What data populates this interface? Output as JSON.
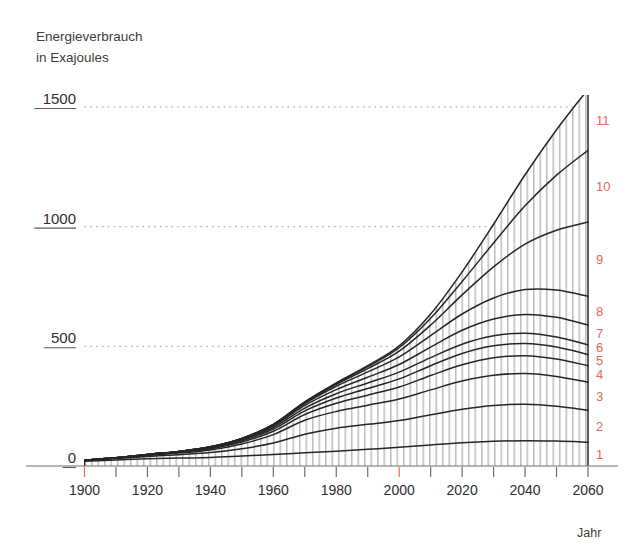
{
  "chart_data": {
    "type": "area",
    "title": "Energieverbrauch in Exajoules",
    "title_line1": "Energieverbrauch",
    "title_line2": "in Exajoules",
    "ylabel": "Energieverbrauch in Exajoules",
    "xlabel": "Jahr",
    "grid": true,
    "legend_position": "right-inline",
    "xlim": [
      1900,
      2060
    ],
    "ylim": [
      0,
      1550
    ],
    "yticks": [
      0,
      500,
      1000,
      1500
    ],
    "ytick_labels": [
      "0",
      "500",
      "1000",
      "1500"
    ],
    "xticks": [
      1900,
      1920,
      1940,
      1960,
      1980,
      2000,
      2020,
      2040,
      2060
    ],
    "xtick_labels": [
      "1900",
      "1920",
      "1940",
      "1960",
      "1980",
      "2000",
      "2020",
      "2040",
      "2060"
    ],
    "xticks_minor": [
      1910,
      1930,
      1950,
      1970,
      1990,
      2010,
      2030,
      2050
    ],
    "xticks_highlight": [
      1900,
      2000
    ],
    "highlight_color": "#e4675b",
    "line_color": "#262626",
    "hatch_color": "#9a9a9a",
    "grid_color": "#9a9a9a",
    "axis_color": "#6e6e6e",
    "x": [
      1900,
      1910,
      1920,
      1930,
      1940,
      1950,
      1960,
      1970,
      1980,
      1990,
      2000,
      2010,
      2020,
      2030,
      2040,
      2050,
      2060
    ],
    "series": [
      {
        "name": "1",
        "label": "1",
        "values": [
          20,
          25,
          30,
          33,
          36,
          42,
          48,
          55,
          62,
          70,
          78,
          88,
          97,
          103,
          106,
          104,
          99
        ]
      },
      {
        "name": "2",
        "label": "2",
        "values": [
          3,
          6,
          10,
          14,
          20,
          30,
          48,
          78,
          96,
          104,
          112,
          126,
          140,
          150,
          152,
          146,
          134
        ]
      },
      {
        "name": "3",
        "label": "3",
        "values": [
          1,
          2,
          4,
          7,
          11,
          20,
          35,
          58,
          70,
          80,
          90,
          104,
          118,
          126,
          128,
          124,
          117
        ]
      },
      {
        "name": "4",
        "label": "4",
        "values": [
          0,
          1,
          2,
          3,
          5,
          8,
          14,
          24,
          34,
          42,
          50,
          60,
          68,
          73,
          75,
          73,
          69
        ]
      },
      {
        "name": "5",
        "label": "5",
        "values": [
          0,
          0,
          1,
          2,
          3,
          5,
          9,
          15,
          22,
          28,
          34,
          41,
          47,
          50,
          51,
          50,
          47
        ]
      },
      {
        "name": "6",
        "label": "6",
        "values": [
          0,
          0,
          1,
          1,
          2,
          4,
          7,
          12,
          18,
          23,
          28,
          34,
          39,
          42,
          43,
          42,
          40
        ]
      },
      {
        "name": "7",
        "label": "7",
        "values": [
          0,
          0,
          0,
          1,
          2,
          3,
          6,
          11,
          17,
          24,
          32,
          44,
          58,
          70,
          78,
          82,
          83
        ]
      },
      {
        "name": "8",
        "label": "8",
        "values": [
          0,
          0,
          0,
          0,
          1,
          2,
          4,
          8,
          14,
          22,
          32,
          48,
          68,
          88,
          104,
          114,
          120
        ]
      },
      {
        "name": "9",
        "label": "9",
        "values": [
          0,
          0,
          0,
          0,
          0,
          1,
          2,
          4,
          8,
          14,
          24,
          44,
          80,
          130,
          190,
          250,
          310
        ]
      },
      {
        "name": "10",
        "label": "10",
        "values": [
          0,
          0,
          0,
          0,
          0,
          0,
          1,
          2,
          4,
          8,
          14,
          28,
          56,
          100,
          160,
          230,
          300
        ]
      },
      {
        "name": "11",
        "label": "11",
        "values": [
          0,
          0,
          0,
          0,
          0,
          0,
          0,
          1,
          2,
          4,
          8,
          18,
          40,
          78,
          130,
          190,
          255
        ]
      }
    ],
    "band_labels": [
      "1",
      "2",
      "3",
      "4",
      "5",
      "6",
      "7",
      "8",
      "9",
      "10",
      "11"
    ],
    "total_2060": 1573
  }
}
